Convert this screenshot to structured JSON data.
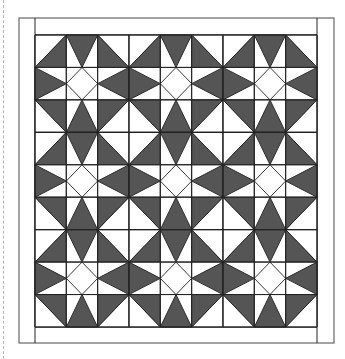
{
  "diagram": {
    "type": "quilt-layout",
    "blocks": {
      "rows": 3,
      "cols": 3
    },
    "cells_per_block": 3,
    "colors": {
      "dark_fabric": "#555555",
      "light_fabric": "#ffffff",
      "outline": "#222222",
      "cut_line": "#b5b5b5"
    },
    "frame": {
      "outer": {
        "x": 19,
        "y": 18,
        "w": 315,
        "h": 325
      },
      "inner": {
        "x": 35,
        "y": 35,
        "w": 282,
        "h": 292
      },
      "border_strips": [
        "left",
        "right",
        "top",
        "bottom"
      ]
    },
    "block_pattern": [
      [
        "corner-triangle-se",
        "edge-triangle-top",
        "corner-triangle-sw"
      ],
      [
        "edge-triangle-left",
        "center-diamond",
        "edge-triangle-right"
      ],
      [
        "corner-triangle-ne",
        "edge-triangle-bottom",
        "corner-triangle-nw"
      ]
    ]
  }
}
